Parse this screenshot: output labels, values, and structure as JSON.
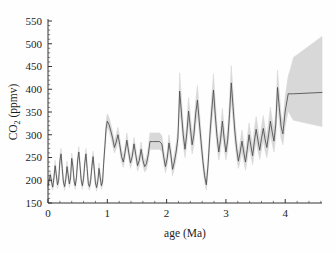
{
  "figure": {
    "background": "#fefefe",
    "line_color": "#4a4a4a",
    "band_color": "#d5d5d5",
    "axis_color": "#333333"
  },
  "axes": {
    "y_title_main": "CO",
    "y_title_sub": "2",
    "y_title_unit": " (ppmv)",
    "y_title_full": "CO2 (ppmv)",
    "x_title": "age (Ma)",
    "y_ticks": [
      150,
      200,
      250,
      300,
      350,
      400,
      450,
      500,
      550
    ],
    "x_ticks": [
      0,
      1,
      2,
      3,
      4
    ],
    "x_minor_step": 0.2,
    "y_minor_step": 10
  },
  "chart_data": {
    "type": "line",
    "title": "",
    "xlabel": "age (Ma)",
    "ylabel": "CO2 (ppmv)",
    "xlim": [
      0,
      4.62
    ],
    "ylim": [
      150,
      550
    ],
    "grid": false,
    "legend": "none",
    "series": [
      {
        "name": "CO2 reconstruction",
        "color": "#4a4a4a",
        "x": [
          0.0,
          0.02,
          0.04,
          0.06,
          0.08,
          0.1,
          0.12,
          0.14,
          0.16,
          0.18,
          0.2,
          0.22,
          0.24,
          0.26,
          0.28,
          0.3,
          0.32,
          0.34,
          0.36,
          0.38,
          0.4,
          0.42,
          0.44,
          0.46,
          0.48,
          0.5,
          0.52,
          0.54,
          0.56,
          0.58,
          0.6,
          0.62,
          0.64,
          0.66,
          0.68,
          0.7,
          0.72,
          0.74,
          0.76,
          0.78,
          0.8,
          0.82,
          0.84,
          0.86,
          0.88,
          0.9,
          0.92,
          0.94,
          0.96,
          0.98,
          1.0,
          1.03,
          1.06,
          1.09,
          1.12,
          1.15,
          1.18,
          1.21,
          1.24,
          1.27,
          1.3,
          1.33,
          1.36,
          1.39,
          1.42,
          1.45,
          1.48,
          1.51,
          1.54,
          1.57,
          1.6,
          1.63,
          1.66,
          1.69,
          1.72,
          1.76,
          1.8,
          1.84,
          1.88,
          1.92,
          1.95,
          1.98,
          2.01,
          2.04,
          2.07,
          2.1,
          2.13,
          2.16,
          2.19,
          2.22,
          2.25,
          2.28,
          2.31,
          2.34,
          2.37,
          2.4,
          2.43,
          2.46,
          2.49,
          2.52,
          2.55,
          2.58,
          2.61,
          2.64,
          2.67,
          2.7,
          2.73,
          2.76,
          2.79,
          2.82,
          2.85,
          2.88,
          2.91,
          2.94,
          2.97,
          3.0,
          3.03,
          3.06,
          3.09,
          3.12,
          3.15,
          3.18,
          3.21,
          3.24,
          3.27,
          3.3,
          3.33,
          3.36,
          3.39,
          3.42,
          3.45,
          3.48,
          3.51,
          3.54,
          3.57,
          3.6,
          3.63,
          3.66,
          3.69,
          3.72,
          3.75,
          3.78,
          3.81,
          3.84,
          3.87,
          3.9,
          3.93,
          3.96,
          4.0,
          4.05,
          4.1,
          4.14,
          4.62
        ],
        "values": [
          188,
          200,
          212,
          196,
          185,
          205,
          232,
          212,
          190,
          200,
          242,
          258,
          226,
          196,
          186,
          202,
          230,
          212,
          192,
          205,
          248,
          230,
          198,
          188,
          206,
          244,
          262,
          232,
          200,
          188,
          204,
          238,
          258,
          226,
          192,
          186,
          200,
          230,
          252,
          224,
          194,
          184,
          198,
          226,
          206,
          188,
          196,
          240,
          276,
          314,
          330,
          322,
          308,
          292,
          272,
          284,
          300,
          278,
          252,
          240,
          262,
          288,
          262,
          238,
          252,
          280,
          256,
          232,
          244,
          268,
          244,
          230,
          236,
          256,
          285,
          285,
          285,
          285,
          285,
          280,
          252,
          230,
          248,
          282,
          258,
          224,
          240,
          262,
          292,
          396,
          348,
          300,
          268,
          302,
          352,
          316,
          278,
          300,
          346,
          376,
          330,
          286,
          244,
          210,
          190,
          236,
          300,
          352,
          398,
          344,
          296,
          262,
          290,
          330,
          292,
          262,
          288,
          344,
          414,
          362,
          308,
          270,
          242,
          262,
          286,
          262,
          240,
          268,
          300,
          276,
          254,
          286,
          312,
          288,
          266,
          292,
          314,
          290,
          272,
          300,
          330,
          306,
          286,
          322,
          404,
          360,
          318,
          302,
          352,
          390,
          390,
          390,
          393
        ],
        "band_lower": [
          182,
          192,
          204,
          188,
          178,
          196,
          222,
          202,
          182,
          192,
          232,
          248,
          216,
          188,
          178,
          194,
          220,
          202,
          184,
          196,
          238,
          220,
          190,
          180,
          198,
          234,
          252,
          222,
          192,
          180,
          196,
          228,
          248,
          216,
          184,
          178,
          192,
          220,
          242,
          214,
          186,
          176,
          190,
          216,
          198,
          180,
          188,
          230,
          264,
          300,
          316,
          308,
          294,
          278,
          260,
          270,
          286,
          266,
          240,
          228,
          250,
          274,
          250,
          226,
          240,
          266,
          244,
          220,
          232,
          254,
          232,
          218,
          224,
          242,
          268,
          268,
          268,
          268,
          268,
          264,
          238,
          216,
          234,
          266,
          244,
          210,
          226,
          246,
          274,
          358,
          320,
          278,
          250,
          280,
          324,
          292,
          258,
          278,
          320,
          346,
          306,
          266,
          228,
          196,
          178,
          220,
          278,
          324,
          364,
          316,
          274,
          244,
          268,
          304,
          270,
          244,
          266,
          316,
          378,
          332,
          284,
          250,
          226,
          242,
          264,
          242,
          222,
          246,
          276,
          254,
          234,
          262,
          286,
          264,
          246,
          268,
          288,
          266,
          250,
          274,
          300,
          280,
          262,
          294,
          366,
          330,
          292,
          278,
          320,
          352,
          340,
          332,
          318
        ],
        "band_upper": [
          196,
          210,
          222,
          206,
          194,
          216,
          244,
          224,
          200,
          210,
          254,
          270,
          238,
          206,
          196,
          212,
          242,
          224,
          202,
          216,
          260,
          242,
          208,
          198,
          216,
          256,
          274,
          244,
          210,
          198,
          214,
          250,
          270,
          238,
          202,
          196,
          210,
          242,
          264,
          236,
          204,
          194,
          208,
          238,
          216,
          198,
          206,
          252,
          290,
          330,
          346,
          338,
          322,
          306,
          286,
          300,
          316,
          292,
          266,
          254,
          276,
          304,
          276,
          250,
          266,
          294,
          270,
          244,
          258,
          284,
          258,
          242,
          250,
          272,
          304,
          304,
          304,
          304,
          304,
          298,
          268,
          244,
          264,
          300,
          274,
          238,
          256,
          280,
          312,
          436,
          378,
          324,
          288,
          326,
          382,
          342,
          300,
          324,
          374,
          408,
          356,
          308,
          262,
          226,
          204,
          254,
          324,
          382,
          434,
          374,
          320,
          282,
          314,
          358,
          316,
          282,
          312,
          374,
          452,
          394,
          334,
          292,
          260,
          284,
          310,
          284,
          260,
          292,
          326,
          300,
          276,
          312,
          340,
          314,
          288,
          318,
          342,
          316,
          296,
          328,
          360,
          334,
          312,
          352,
          442,
          392,
          346,
          328,
          384,
          428,
          450,
          470,
          516
        ]
      }
    ]
  }
}
